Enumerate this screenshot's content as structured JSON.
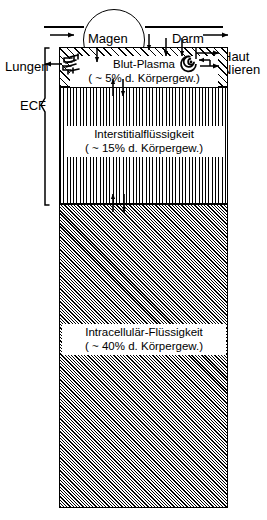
{
  "figure": {
    "ecf_label": "ECF"
  },
  "organs": [
    {
      "id": "magen",
      "label": "Magen",
      "name": "stomach-label"
    },
    {
      "id": "darm",
      "label": "Darm",
      "name": "intestine-label"
    },
    {
      "id": "lungen",
      "label": "Lungen",
      "name": "lungs-label"
    },
    {
      "id": "haut",
      "label": "Haut",
      "name": "skin-label"
    },
    {
      "id": "nieren",
      "label": "Nieren",
      "name": "kidneys-label"
    }
  ],
  "compartments": [
    {
      "id": "plasma",
      "name": "Blut-Plasma",
      "amount": "( ~ 5% d. Körpergew.)",
      "percent": 5,
      "hatch": "diagonal-coarse"
    },
    {
      "id": "interstitial",
      "name": "Interstitialflüssigkeit",
      "amount": "( ~ 15% d. Körpergew.)",
      "percent": 15,
      "hatch": "vertical-fine"
    },
    {
      "id": "intracellular",
      "name": "Intracellulär-Flüssigkeit",
      "amount": "( ~ 40% d. Körpergew.)",
      "percent": 40,
      "hatch": "diagonal-dense"
    }
  ],
  "icons": {
    "lung_symbol": "lung-coil-icon",
    "kidney_symbol": "kidney-spiral-icon"
  }
}
